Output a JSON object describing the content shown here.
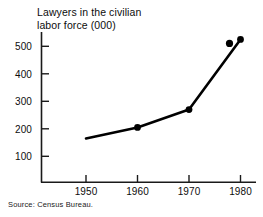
{
  "chart_data": {
    "type": "line",
    "title": "Lawyers in the civilian\nlabor force (000)",
    "title_line1": "Lawyers in the civilian",
    "title_line2": "labor force (000)",
    "xlabel": "",
    "ylabel": "",
    "x": [
      1950,
      1960,
      1970,
      1980
    ],
    "categories": [
      "1950",
      "1960",
      "1970",
      "1980"
    ],
    "values": [
      165,
      205,
      270,
      525
    ],
    "series": [
      {
        "name": "Lawyers in the civilian labor force (000)",
        "values": [
          165,
          205,
          270,
          525
        ]
      }
    ],
    "xlim": [
      1945,
      1984
    ],
    "ylim": [
      0,
      560
    ],
    "ytick_labels": [
      "100",
      "200",
      "300",
      "400",
      "500"
    ],
    "ytick_values": [
      100,
      200,
      300,
      400,
      500
    ],
    "xtick_labels": [
      "1950",
      "1960",
      "1970",
      "1980"
    ],
    "xtick_values": [
      1950,
      1960,
      1970,
      1980
    ],
    "grid": false,
    "legend": false,
    "legend_position": "none",
    "marker": "filled-circle",
    "line_color": "#000000",
    "marker_color": "#000000",
    "axis_color": "#1a1a1a",
    "background_color": "#ffffff",
    "source_note": "Source: Census Bureau."
  },
  "figure": {
    "source_label": "Source: Census Bureau."
  }
}
